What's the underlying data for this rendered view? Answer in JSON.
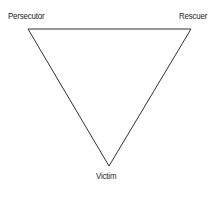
{
  "diagram": {
    "nodes": [
      {
        "id": "persecutor",
        "label": "Persecutor",
        "position": "top-left"
      },
      {
        "id": "rescuer",
        "label": "Rescuer",
        "position": "top-right"
      },
      {
        "id": "victim",
        "label": "Victim",
        "position": "bottom"
      }
    ],
    "edges": [
      {
        "from": "persecutor",
        "to": "rescuer"
      },
      {
        "from": "rescuer",
        "to": "victim"
      },
      {
        "from": "victim",
        "to": "persecutor"
      }
    ],
    "colors": {
      "line": "#333333",
      "text": "#222222",
      "background": "#ffffff"
    }
  }
}
